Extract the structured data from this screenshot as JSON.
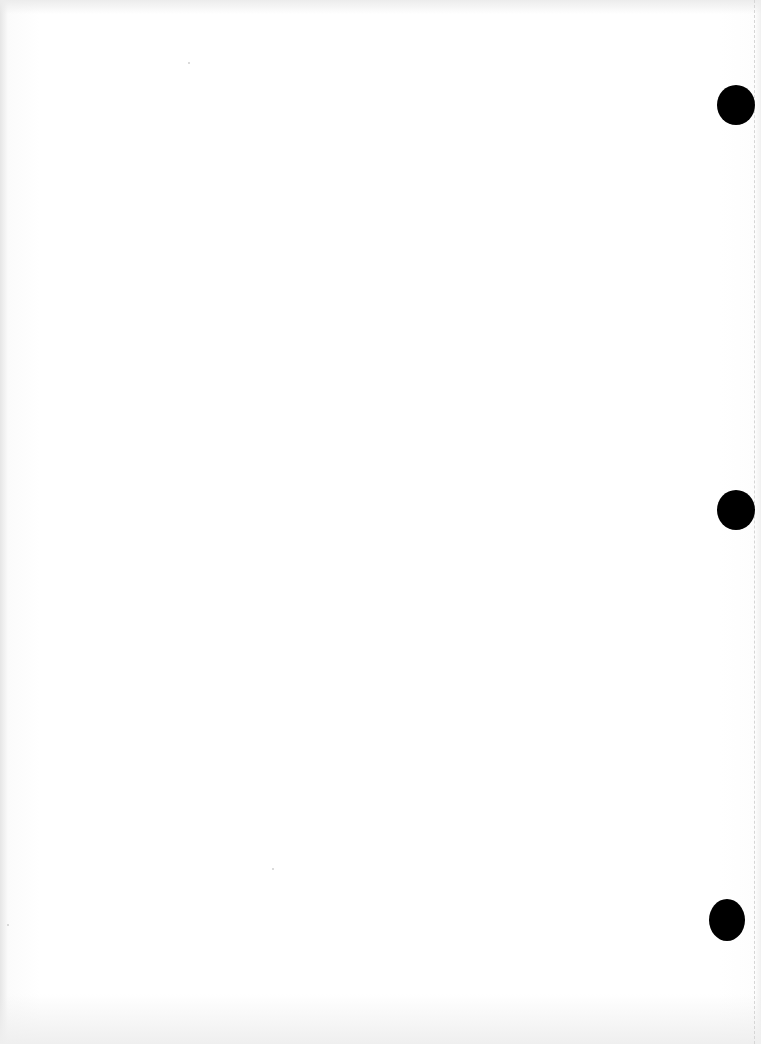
{
  "document": {
    "type": "scanned blank page",
    "text": "",
    "colors": {
      "paper": "#ffffff",
      "edge_shadow": "#e6e6e6",
      "punch_hole": "#000000",
      "margin_line": "#d6d6d6"
    },
    "punch_holes": [
      {
        "x": 717,
        "y": 85
      },
      {
        "x": 717,
        "y": 490
      },
      {
        "x": 709,
        "y": 899
      }
    ]
  }
}
